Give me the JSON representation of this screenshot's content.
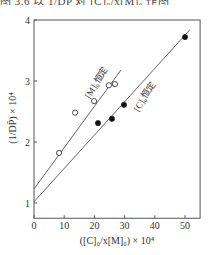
{
  "page": {
    "top_cut_text": "图 3.6 以 1/DP̄ 对 [C]₀/x[M]₀ 作图"
  },
  "chart_data": {
    "type": "scatter",
    "title": "",
    "xlabel": "([C]₀/x[M]₀) × 10⁴",
    "ylabel": "(1/DP̄) × 10⁴",
    "xlim": [
      0,
      55
    ],
    "ylim": [
      0.75,
      4
    ],
    "x_ticks": [
      0,
      10,
      20,
      30,
      40,
      50
    ],
    "y_ticks": [
      1,
      2,
      3,
      4
    ],
    "grid": false,
    "legend": null,
    "series": [
      {
        "name": "[M]₀恒定",
        "marker": "open-circle",
        "points": [
          {
            "x": 8.3,
            "y": 1.82
          },
          {
            "x": 13.6,
            "y": 2.48
          },
          {
            "x": 19.9,
            "y": 2.67
          },
          {
            "x": 24.8,
            "y": 2.93
          },
          {
            "x": 26.8,
            "y": 2.95
          }
        ],
        "fit_line": {
          "x0": 0,
          "y0": 1.23,
          "x1": 28.8,
          "y1": 3.18
        },
        "label": "[M]₀恒定",
        "label_pos": {
          "x": 21.5,
          "y": 2.95,
          "angle": -58
        }
      },
      {
        "name": "[C]₀恒定",
        "marker": "filled-circle",
        "points": [
          {
            "x": 21.2,
            "y": 2.31
          },
          {
            "x": 25.8,
            "y": 2.38
          },
          {
            "x": 29.8,
            "y": 2.61
          },
          {
            "x": 50.0,
            "y": 3.72
          }
        ],
        "fit_line": {
          "x0": 0,
          "y0": 1.02,
          "x1": 51.6,
          "y1": 3.84
        },
        "label": "[C]₀恒定",
        "label_pos": {
          "x": 37.5,
          "y": 2.72,
          "angle": -58
        }
      }
    ]
  },
  "colors": {
    "axis": "#555555",
    "line": "#555555",
    "marker_fill": "#111111",
    "marker_open": "#ffffff",
    "background": "#ffffff"
  }
}
